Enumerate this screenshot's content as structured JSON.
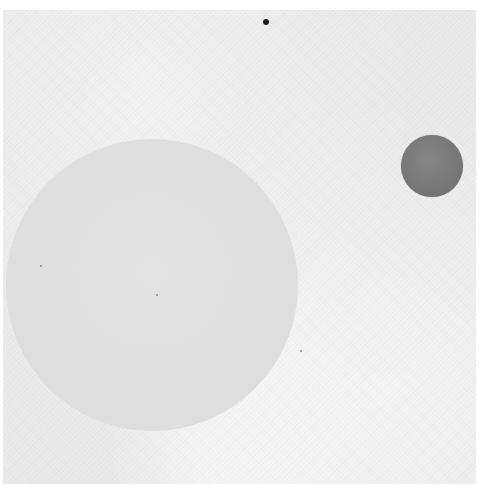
{
  "artwork": {
    "background_color": "#ebebeb",
    "shapes": [
      {
        "type": "circle",
        "role": "large-pale-circle",
        "cx": 152,
        "cy": 285,
        "r": 146,
        "color": "#e1e1e1"
      },
      {
        "type": "circle",
        "role": "small-dark-circle",
        "cx": 432,
        "cy": 166,
        "r": 31,
        "color": "#7c7c7c"
      },
      {
        "type": "dot",
        "role": "black-dot",
        "cx": 266,
        "cy": 22,
        "r": 3,
        "color": "#1a1a1a"
      }
    ]
  }
}
